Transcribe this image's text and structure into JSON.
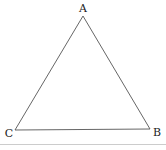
{
  "diagram": {
    "type": "triangle",
    "vertices": [
      {
        "name": "A",
        "x": 83,
        "y": 16,
        "label_x": 83,
        "label_y": 12
      },
      {
        "name": "B",
        "x": 150,
        "y": 129,
        "label_x": 157,
        "label_y": 136
      },
      {
        "name": "C",
        "x": 15,
        "y": 130,
        "label_x": 9,
        "label_y": 137
      }
    ],
    "stroke_color": "#555555",
    "divider_color": "#cccccc"
  }
}
